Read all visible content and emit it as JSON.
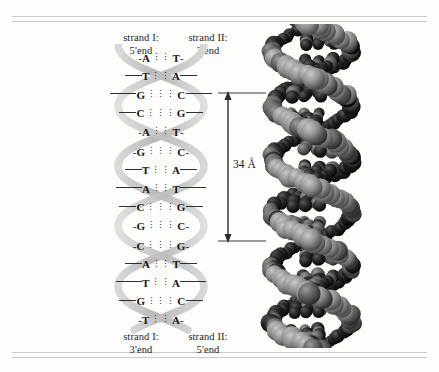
{
  "figure": {
    "background_color": "#fdfdfb",
    "rule_color": "#c9c9c9"
  },
  "labels": {
    "top_left": {
      "strand": "strand I:",
      "end": "5'end"
    },
    "top_right": {
      "strand": "strand II:",
      "end": "3'end"
    },
    "bottom_left": {
      "strand": "strand I:",
      "end": "3'end"
    },
    "bottom_right": {
      "strand": "strand II:",
      "end": "5'end"
    }
  },
  "dimension": {
    "value": "34 Å",
    "arrow": "double-headed-vertical-arrow"
  },
  "helix": {
    "turns": 3,
    "ribbon_color": "#c6c6c6",
    "segments": [
      {
        "name": "upper-turn",
        "base_pairs": [
          {
            "left": "A",
            "right": "T",
            "bonds": 2,
            "width": "narrow"
          },
          {
            "left": "T",
            "right": "A",
            "bonds": 2,
            "width": "medium"
          },
          {
            "left": "G",
            "right": "C",
            "bonds": 3,
            "width": "wide"
          },
          {
            "left": "C",
            "right": "G",
            "bonds": 3,
            "width": "medium"
          },
          {
            "left": "A",
            "right": "T",
            "bonds": 2,
            "width": "narrow"
          }
        ]
      },
      {
        "name": "middle-turn",
        "base_pairs": [
          {
            "left": "G",
            "right": "C",
            "bonds": 3,
            "width": "narrow"
          },
          {
            "left": "T",
            "right": "A",
            "bonds": 2,
            "width": "medium"
          },
          {
            "left": "A",
            "right": "T",
            "bonds": 2,
            "width": "wide"
          },
          {
            "left": "C",
            "right": "G",
            "bonds": 3,
            "width": "medium"
          },
          {
            "left": "G",
            "right": "C",
            "bonds": 3,
            "width": "narrow"
          }
        ]
      },
      {
        "name": "lower-turn",
        "base_pairs": [
          {
            "left": "C",
            "right": "G",
            "bonds": 3,
            "width": "narrow"
          },
          {
            "left": "A",
            "right": "T",
            "bonds": 2,
            "width": "medium"
          },
          {
            "left": "T",
            "right": "A",
            "bonds": 2,
            "width": "wide"
          },
          {
            "left": "G",
            "right": "C",
            "bonds": 3,
            "width": "medium"
          },
          {
            "left": "T",
            "right": "A",
            "bonds": 2,
            "width": "narrow"
          }
        ]
      }
    ]
  },
  "model": {
    "caption": "space-filling-dna-model",
    "description": "grayscale space filling atomic model of DNA double helix"
  }
}
